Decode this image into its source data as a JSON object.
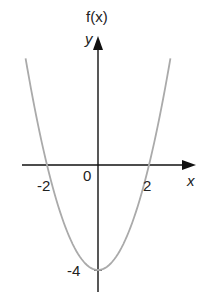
{
  "chart_data": {
    "type": "line",
    "title": "",
    "function": "f(x) = x^2 - 4",
    "xlabel": "x",
    "ylabel": "y",
    "ylabel_alt": "f(x)",
    "origin_label": "0",
    "x_tick_labels": [
      "-2",
      "2"
    ],
    "y_tick_labels": [
      "-4"
    ],
    "xlim": [
      -3.5,
      3.8
    ],
    "ylim": [
      -5.2,
      4.9
    ],
    "grid": false,
    "legend": null,
    "series": [
      {
        "name": "f(x)",
        "color": "#aaaaaa",
        "x": [
          -2.84,
          -2.5,
          -2,
          -1.5,
          -1,
          -0.5,
          0,
          0.5,
          1,
          1.5,
          2,
          2.5,
          2.84
        ],
        "y": [
          4.07,
          2.25,
          0,
          -1.75,
          -3,
          -3.75,
          -4,
          -3.75,
          -3,
          -1.75,
          0,
          2.25,
          4.07
        ]
      }
    ],
    "key_points": [
      {
        "x": -2,
        "y": 0,
        "label": "-2"
      },
      {
        "x": 2,
        "y": 0,
        "label": "2"
      },
      {
        "x": 0,
        "y": -4,
        "label": "-4"
      }
    ]
  },
  "labels": {
    "fx": "f(x)",
    "y": "y",
    "x": "x",
    "origin": "0",
    "xneg2": "-2",
    "xpos2": "2",
    "yneg4": "-4"
  },
  "colors": {
    "axis": "#111111",
    "curve": "#aaaaaa"
  }
}
